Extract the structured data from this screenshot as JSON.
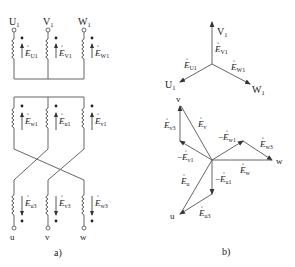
{
  "figure": {
    "panel_a": {
      "caption": "a)",
      "top_terminals": [
        "U",
        "V",
        "W"
      ],
      "top_subscript": "1",
      "top_emf": [
        {
          "base": "E",
          "sub": "U1"
        },
        {
          "base": "E",
          "sub": "V1"
        },
        {
          "base": "E",
          "sub": "W1"
        }
      ],
      "mid_emf": [
        {
          "base": "E",
          "sub": "w1"
        },
        {
          "base": "E",
          "sub": "u1"
        },
        {
          "base": "E",
          "sub": "v1"
        }
      ],
      "bottom_emf": [
        {
          "base": "E",
          "sub": "u3"
        },
        {
          "base": "E",
          "sub": "v3"
        },
        {
          "base": "E",
          "sub": "w3"
        }
      ],
      "bottom_terminals": [
        "u",
        "v",
        "w"
      ]
    },
    "panel_b": {
      "caption": "b)",
      "top_star": {
        "tips": [
          {
            "label": "V",
            "sub": "1"
          },
          {
            "label": "U",
            "sub": "1"
          },
          {
            "label": "W",
            "sub": "1"
          }
        ],
        "emf": [
          {
            "base": "E",
            "sub": "V1"
          },
          {
            "base": "E",
            "sub": "U1"
          },
          {
            "base": "E",
            "sub": "W1"
          }
        ]
      },
      "bottom_star": {
        "tips": [
          "v",
          "w",
          "u"
        ],
        "emf": {
          "Ev": {
            "base": "E",
            "sub": "v"
          },
          "Ev3": {
            "base": "E",
            "sub": "v3"
          },
          "neg_Ev1": {
            "prefix": "−",
            "base": "E",
            "sub": "v1"
          },
          "neg_Ew1": {
            "prefix": "−",
            "base": "E",
            "sub": "w1"
          },
          "Ew3": {
            "base": "E",
            "sub": "w3"
          },
          "Ew": {
            "base": "E",
            "sub": "w"
          },
          "Eu": {
            "base": "E",
            "sub": "u"
          },
          "neg_Eu1": {
            "prefix": "−",
            "base": "E",
            "sub": "u1"
          },
          "Eu3": {
            "base": "E",
            "sub": "u3"
          }
        }
      }
    }
  }
}
